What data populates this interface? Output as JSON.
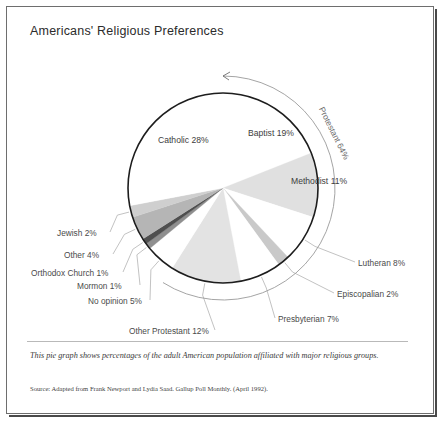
{
  "figure": {
    "title": "Americans' Religious Preferences",
    "caption": "This pie graph shows percentages of the adult American population affiliated with major religious groups.",
    "source": "Source: Adapted from Frank Newport and Lydia Saad. Gallup Poll Monthly. (April 1992).",
    "bracket_label": "Protestant 64%"
  },
  "labels": {
    "catholic": "Catholic 28%",
    "baptist": "Baptist 19%",
    "methodist": "Methodist 11%",
    "lutheran": "Lutheran 8%",
    "episcopalian": "Episcopalian  2%",
    "presbyterian": "Presbyterian 7%",
    "other_protestant": "Other Protestant 12%",
    "no_opinion": "No opinion 5%",
    "mormon": "Mormon 1%",
    "orthodox": "Orthodox Church 1%",
    "other": "Other 4%",
    "jewish": "Jewish 2%"
  },
  "chart_data": {
    "type": "pie",
    "title": "Americans' Religious Preferences",
    "unit": "percent",
    "total": 100,
    "start_angle_deg": -90,
    "direction": "clockwise",
    "legend": "none",
    "grid": false,
    "annotations": [
      {
        "text": "Protestant 64%",
        "covers": [
          "Baptist",
          "Methodist",
          "Lutheran",
          "Episcopalian",
          "Presbyterian",
          "Other Protestant"
        ],
        "value": 64,
        "type": "outer-bracket-arc"
      }
    ],
    "categories": [
      "Baptist",
      "Methodist",
      "Lutheran",
      "Episcopalian",
      "Presbyterian",
      "Other Protestant",
      "No opinion",
      "Mormon",
      "Orthodox Church",
      "Other",
      "Jewish",
      "Catholic"
    ],
    "values": [
      19,
      11,
      8,
      2,
      7,
      12,
      5,
      1,
      1,
      4,
      2,
      28
    ],
    "slices": [
      {
        "label": "Baptist 19%",
        "name": "Baptist",
        "value": 19,
        "color": "#ffffff"
      },
      {
        "label": "Methodist 11%",
        "name": "Methodist",
        "value": 11,
        "color": "#e0e0e0"
      },
      {
        "label": "Lutheran 8%",
        "name": "Lutheran",
        "value": 8,
        "color": "#ffffff"
      },
      {
        "label": "Episcopalian  2%",
        "name": "Episcopalian",
        "value": 2,
        "color": "#c9c9c9"
      },
      {
        "label": "Presbyterian 7%",
        "name": "Presbyterian",
        "value": 7,
        "color": "#ffffff"
      },
      {
        "label": "Other Protestant 12%",
        "name": "Other Protestant",
        "value": 12,
        "color": "#e3e3e3"
      },
      {
        "label": "No opinion 5%",
        "name": "No opinion",
        "value": 5,
        "color": "#ffffff"
      },
      {
        "label": "Mormon 1%",
        "name": "Mormon",
        "value": 1,
        "color": "#8f8f8f"
      },
      {
        "label": "Orthodox Church 1%",
        "name": "Orthodox Church",
        "value": 1,
        "color": "#4f4f4f"
      },
      {
        "label": "Other 4%",
        "name": "Other",
        "value": 4,
        "color": "#b5b5b5"
      },
      {
        "label": "Jewish 2%",
        "name": "Jewish",
        "value": 2,
        "color": "#cfcfcf"
      },
      {
        "label": "Catholic 28%",
        "name": "Catholic",
        "value": 28,
        "color": "#ffffff"
      }
    ]
  },
  "colors": {
    "outline": "#1d1d1d",
    "frame": "#6e6e6e",
    "leader": "#a8a8a8",
    "text": "#4a4a4a"
  }
}
